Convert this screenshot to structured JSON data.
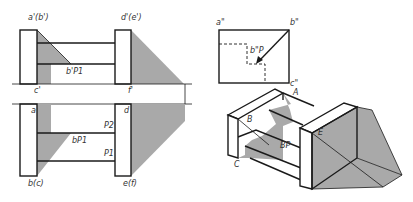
{
  "colors": {
    "line": "#1a1a1a",
    "shadow": "#a9a9a9",
    "background": "#ffffff"
  },
  "front_view": {
    "labels": {
      "a_b": "a'(b')",
      "d_e": "d'(e')",
      "bp1": "b'P1",
      "c": "c'",
      "f": "f'"
    }
  },
  "top_view": {
    "labels": {
      "a": "a",
      "d": "d",
      "p2": "P2",
      "p1": "P1",
      "bp1": "bP1",
      "b_c": "b(c)",
      "e_f": "e(f)"
    }
  },
  "side_view": {
    "labels": {
      "a": "a\"",
      "b": "b\"",
      "bp": "b\"P",
      "c": "c\""
    }
  },
  "axonometric": {
    "labels": {
      "A": "A",
      "B": "B",
      "Bp": "BP",
      "C": "C",
      "E": "E"
    }
  }
}
